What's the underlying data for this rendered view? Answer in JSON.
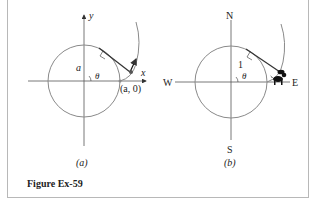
{
  "figure": {
    "caption": "Figure Ex-59",
    "panels": [
      {
        "id": "a",
        "sublabel": "(a)",
        "axis_labels": {
          "x": "x",
          "y": "y"
        },
        "radius_label": "a",
        "angle_label": "θ",
        "point_label": "(a, 0)"
      },
      {
        "id": "b",
        "sublabel": "(b)",
        "compass": {
          "north": "N",
          "south": "S",
          "east": "E",
          "west": "W"
        },
        "radius_label": "1",
        "angle_label": "θ"
      }
    ]
  },
  "colors": {
    "circle": "#8a8a8a",
    "axis": "#555555",
    "tangent": "#333333",
    "text": "#222222",
    "frame": "#b8b8b8"
  }
}
